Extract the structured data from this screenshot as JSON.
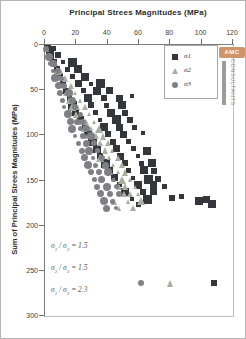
{
  "logo": {
    "badge": "AMC",
    "vertical_text": "CONSULTANTS",
    "badge_color": "#cf9469",
    "bar_color": "#9c9c9c"
  },
  "chart_data": {
    "type": "scatter",
    "title": "Principal Strees Magnitudes (MPa)",
    "xlabel": "Principal Strees Magnitudes (MPa)",
    "ylabel": "Sum of Principal Strees Magnitudes (MPa)",
    "xlim": [
      0,
      120
    ],
    "ylim": [
      0,
      300
    ],
    "y_axis_inverted": true,
    "x_axis_position": "top",
    "grid": false,
    "x_ticks": [
      0,
      20,
      40,
      60,
      80,
      100,
      120
    ],
    "y_ticks": [
      0,
      50,
      100,
      150,
      200,
      250,
      300
    ],
    "legend_position": "upper-right",
    "series": [
      {
        "name": "σ1",
        "marker": "square",
        "color": "#33363b",
        "sizes": [
          7,
          5,
          8,
          6,
          7,
          4,
          9,
          6,
          5,
          8
        ],
        "points": [
          [
            2,
            5
          ],
          [
            6,
            5
          ],
          [
            4,
            12
          ],
          [
            9,
            12
          ],
          [
            6,
            20
          ],
          [
            12,
            20
          ],
          [
            18,
            20
          ],
          [
            8,
            28
          ],
          [
            15,
            28
          ],
          [
            22,
            28
          ],
          [
            10,
            36
          ],
          [
            18,
            36
          ],
          [
            26,
            36
          ],
          [
            12,
            44
          ],
          [
            22,
            44
          ],
          [
            30,
            44
          ],
          [
            36,
            44
          ],
          [
            14,
            52
          ],
          [
            25,
            52
          ],
          [
            34,
            52
          ],
          [
            42,
            52
          ],
          [
            16,
            60
          ],
          [
            28,
            60
          ],
          [
            38,
            60
          ],
          [
            48,
            60
          ],
          [
            56,
            58
          ],
          [
            18,
            68
          ],
          [
            30,
            68
          ],
          [
            40,
            68
          ],
          [
            50,
            68
          ],
          [
            20,
            76
          ],
          [
            33,
            76
          ],
          [
            43,
            76
          ],
          [
            52,
            76
          ],
          [
            23,
            84
          ],
          [
            36,
            84
          ],
          [
            46,
            84
          ],
          [
            55,
            84
          ],
          [
            26,
            92
          ],
          [
            38,
            92
          ],
          [
            48,
            92
          ],
          [
            58,
            92
          ],
          [
            28,
            100
          ],
          [
            41,
            100
          ],
          [
            51,
            100
          ],
          [
            63,
            99
          ],
          [
            31,
            108
          ],
          [
            44,
            108
          ],
          [
            54,
            108
          ],
          [
            34,
            116
          ],
          [
            46,
            116
          ],
          [
            57,
            116
          ],
          [
            66,
            119
          ],
          [
            36,
            124
          ],
          [
            49,
            124
          ],
          [
            60,
            124
          ],
          [
            39,
            132
          ],
          [
            52,
            132
          ],
          [
            62,
            132
          ],
          [
            69,
            132
          ],
          [
            42,
            140
          ],
          [
            54,
            140
          ],
          [
            64,
            140
          ],
          [
            70,
            141
          ],
          [
            45,
            148
          ],
          [
            57,
            148
          ],
          [
            67,
            150
          ],
          [
            73,
            149
          ],
          [
            48,
            156
          ],
          [
            60,
            156
          ],
          [
            70,
            156
          ],
          [
            77,
            158
          ],
          [
            52,
            164
          ],
          [
            63,
            164
          ],
          [
            70,
            163
          ],
          [
            56,
            172
          ],
          [
            66,
            172
          ],
          [
            82,
            171
          ],
          [
            88,
            169
          ],
          [
            99,
            174
          ],
          [
            104,
            172
          ],
          [
            60,
            178
          ],
          [
            107,
            177
          ],
          [
            108.5,
            265
          ]
        ]
      },
      {
        "name": "σ2",
        "marker": "triangle",
        "color": "#a7af9e",
        "sizes": [
          6,
          4,
          7,
          5,
          8,
          5,
          6,
          7,
          4,
          6
        ],
        "points": [
          [
            1.5,
            5
          ],
          [
            4,
            14
          ],
          [
            6,
            22
          ],
          [
            8,
            22
          ],
          [
            8,
            30
          ],
          [
            11,
            30
          ],
          [
            10,
            38
          ],
          [
            14,
            38
          ],
          [
            12,
            46
          ],
          [
            17,
            46
          ],
          [
            14,
            54
          ],
          [
            20,
            54
          ],
          [
            16,
            62
          ],
          [
            23,
            62
          ],
          [
            18,
            70
          ],
          [
            22,
            70
          ],
          [
            26,
            70
          ],
          [
            21,
            78
          ],
          [
            29,
            78
          ],
          [
            23,
            86
          ],
          [
            27,
            86
          ],
          [
            32,
            86
          ],
          [
            26,
            94
          ],
          [
            30,
            94
          ],
          [
            35,
            94
          ],
          [
            28,
            102
          ],
          [
            33,
            102
          ],
          [
            38,
            102
          ],
          [
            31,
            110
          ],
          [
            36,
            110
          ],
          [
            41,
            110
          ],
          [
            34,
            118
          ],
          [
            39,
            118
          ],
          [
            44,
            118
          ],
          [
            36,
            126
          ],
          [
            42,
            126
          ],
          [
            47,
            126
          ],
          [
            39,
            134
          ],
          [
            44,
            134
          ],
          [
            50,
            134
          ],
          [
            42,
            142
          ],
          [
            47,
            142
          ],
          [
            52,
            142
          ],
          [
            45,
            150
          ],
          [
            50,
            150
          ],
          [
            55,
            150
          ],
          [
            48,
            158
          ],
          [
            52,
            158
          ],
          [
            58,
            158
          ],
          [
            51,
            166
          ],
          [
            55,
            166
          ],
          [
            60,
            166
          ],
          [
            45,
            174
          ],
          [
            54,
            174
          ],
          [
            62,
            174
          ],
          [
            48,
            182
          ],
          [
            57,
            182
          ],
          [
            81,
            265
          ]
        ]
      },
      {
        "name": "σ3",
        "marker": "circle",
        "color": "#7f8086",
        "sizes": [
          6,
          8,
          5,
          7,
          4,
          6,
          8,
          5,
          7,
          6
        ],
        "points": [
          [
            1,
            6
          ],
          [
            3,
            14
          ],
          [
            4,
            22
          ],
          [
            6,
            22
          ],
          [
            6,
            30
          ],
          [
            9,
            30
          ],
          [
            7,
            38
          ],
          [
            11,
            38
          ],
          [
            9,
            46
          ],
          [
            13,
            46
          ],
          [
            10,
            54
          ],
          [
            16,
            54
          ],
          [
            12,
            62
          ],
          [
            18,
            62
          ],
          [
            13,
            70
          ],
          [
            20,
            70
          ],
          [
            15,
            78
          ],
          [
            23,
            78
          ],
          [
            17,
            86
          ],
          [
            21,
            86
          ],
          [
            25,
            86
          ],
          [
            18,
            94
          ],
          [
            23,
            94
          ],
          [
            27,
            94
          ],
          [
            20,
            102
          ],
          [
            25,
            102
          ],
          [
            30,
            102
          ],
          [
            22,
            110
          ],
          [
            27,
            110
          ],
          [
            32,
            110
          ],
          [
            24,
            118
          ],
          [
            29,
            118
          ],
          [
            34,
            118
          ],
          [
            26,
            126
          ],
          [
            31,
            126
          ],
          [
            37,
            126
          ],
          [
            28,
            134
          ],
          [
            33,
            134
          ],
          [
            39,
            134
          ],
          [
            30,
            142
          ],
          [
            35,
            142
          ],
          [
            41,
            142
          ],
          [
            32,
            150
          ],
          [
            37,
            150
          ],
          [
            44,
            150
          ],
          [
            34,
            158
          ],
          [
            40,
            158
          ],
          [
            46,
            158
          ],
          [
            36,
            166
          ],
          [
            42,
            166
          ],
          [
            48,
            166
          ],
          [
            38,
            174
          ],
          [
            44,
            174
          ],
          [
            40,
            182
          ],
          [
            46,
            182
          ],
          [
            62,
            265
          ]
        ]
      }
    ],
    "annotations": [
      {
        "num_sym": "σ",
        "num_sub": "1",
        "sep": " / ",
        "den_sym": "σ",
        "den_sub": "2",
        "eq": " = 1.5"
      },
      {
        "num_sym": "σ",
        "num_sub": "2",
        "sep": " / ",
        "den_sym": "σ",
        "den_sub": "3",
        "eq": " = 1.5"
      },
      {
        "num_sym": "σ",
        "num_sub": "1",
        "sep": " / ",
        "den_sym": "σ",
        "den_sub": "3",
        "eq": " = 2.3"
      }
    ]
  }
}
